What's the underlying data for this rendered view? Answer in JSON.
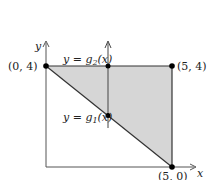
{
  "diagram": {
    "type": "region-between-curves",
    "colors": {
      "region_fill": "#d6d6d6",
      "line": "#333333",
      "axis": "#555555",
      "point": "#000000",
      "background": "#ffffff"
    },
    "axes": {
      "x_label": "x",
      "y_label": "y"
    },
    "points": [
      {
        "label": "(0, 4)",
        "x": 0,
        "y": 4
      },
      {
        "label": "(5, 4)",
        "x": 5,
        "y": 4
      },
      {
        "label": "(5, 0)",
        "x": 5,
        "y": 0
      }
    ],
    "curves": {
      "upper": {
        "label_prefix": "y = g",
        "label_sub": "2",
        "label_suffix": "(x)"
      },
      "lower": {
        "label_prefix": "y = g",
        "label_sub": "1",
        "label_suffix": "(x)"
      }
    },
    "region": {
      "description": "Triangle bounded by y=4, x=5, and line from (0,4) to (5,0)",
      "vertices": [
        [
          0,
          4
        ],
        [
          5,
          4
        ],
        [
          5,
          0
        ]
      ]
    },
    "vertical_strip_arrow": "upward arrow crossing region from g1 to g2"
  }
}
